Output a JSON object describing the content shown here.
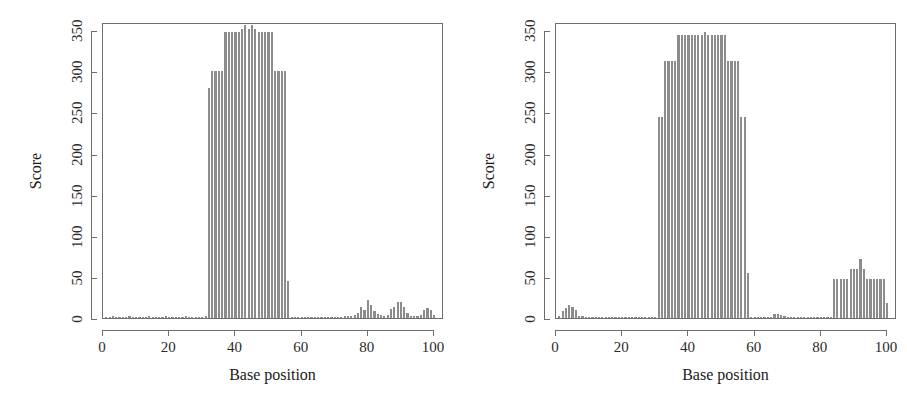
{
  "figure": {
    "panel_count": 2,
    "background_color": "#ffffff",
    "bar_color": "#8c8c8c",
    "axis_color": "#6e6e6e"
  },
  "chart_data": [
    {
      "id": "left-panel",
      "type": "bar",
      "title": "",
      "xlabel": "Base position",
      "ylabel": "Score",
      "xlim": [
        0,
        103
      ],
      "ylim": [
        0,
        360
      ],
      "xticks": [
        0,
        20,
        40,
        60,
        80,
        100
      ],
      "xticklabels": [
        "0",
        "20",
        "40",
        "60",
        "80",
        "100"
      ],
      "yticks": [
        0,
        50,
        100,
        150,
        200,
        250,
        300,
        350
      ],
      "yticklabels": [
        "0",
        "50",
        "100",
        "150",
        "200",
        "250",
        "300",
        "350"
      ],
      "grid": false,
      "legend": null,
      "x": [
        1,
        2,
        3,
        4,
        5,
        6,
        7,
        8,
        9,
        10,
        11,
        12,
        13,
        14,
        15,
        16,
        17,
        18,
        19,
        20,
        21,
        22,
        23,
        24,
        25,
        26,
        27,
        28,
        29,
        30,
        31,
        32,
        33,
        34,
        35,
        36,
        37,
        38,
        39,
        40,
        41,
        42,
        43,
        44,
        45,
        46,
        47,
        48,
        49,
        50,
        51,
        52,
        53,
        54,
        55,
        56,
        57,
        58,
        59,
        60,
        61,
        62,
        63,
        64,
        65,
        66,
        67,
        68,
        69,
        70,
        71,
        72,
        73,
        74,
        75,
        76,
        77,
        78,
        79,
        80,
        81,
        82,
        83,
        84,
        85,
        86,
        87,
        88,
        89,
        90,
        91,
        92,
        93,
        94,
        95,
        96,
        97,
        98,
        99,
        100
      ],
      "values": [
        1,
        1,
        2,
        1,
        1,
        1,
        1,
        2,
        1,
        1,
        1,
        1,
        1,
        2,
        1,
        1,
        1,
        1,
        2,
        1,
        1,
        1,
        1,
        1,
        2,
        1,
        1,
        1,
        1,
        1,
        2,
        280,
        300,
        300,
        300,
        300,
        348,
        348,
        348,
        348,
        348,
        352,
        356,
        352,
        356,
        352,
        348,
        348,
        348,
        348,
        348,
        300,
        300,
        300,
        300,
        45,
        1,
        1,
        1,
        1,
        1,
        1,
        1,
        1,
        1,
        1,
        1,
        1,
        1,
        1,
        1,
        1,
        2,
        2,
        3,
        4,
        6,
        14,
        10,
        22,
        16,
        8,
        5,
        4,
        3,
        4,
        11,
        14,
        20,
        20,
        14,
        6,
        3,
        2,
        2,
        4,
        10,
        12,
        10,
        4
      ]
    },
    {
      "id": "right-panel",
      "type": "bar",
      "title": "",
      "xlabel": "Base position",
      "ylabel": "Score",
      "xlim": [
        0,
        103
      ],
      "ylim": [
        0,
        360
      ],
      "xticks": [
        0,
        20,
        40,
        60,
        80,
        100
      ],
      "xticklabels": [
        "0",
        "20",
        "40",
        "60",
        "80",
        "100"
      ],
      "yticks": [
        0,
        50,
        100,
        150,
        200,
        250,
        300,
        350
      ],
      "yticklabels": [
        "0",
        "50",
        "100",
        "150",
        "200",
        "250",
        "300",
        "350"
      ],
      "grid": false,
      "legend": null,
      "x": [
        1,
        2,
        3,
        4,
        5,
        6,
        7,
        8,
        9,
        10,
        11,
        12,
        13,
        14,
        15,
        16,
        17,
        18,
        19,
        20,
        21,
        22,
        23,
        24,
        25,
        26,
        27,
        28,
        29,
        30,
        31,
        32,
        33,
        34,
        35,
        36,
        37,
        38,
        39,
        40,
        41,
        42,
        43,
        44,
        45,
        46,
        47,
        48,
        49,
        50,
        51,
        52,
        53,
        54,
        55,
        56,
        57,
        58,
        59,
        60,
        61,
        62,
        63,
        64,
        65,
        66,
        67,
        68,
        69,
        70,
        71,
        72,
        73,
        74,
        75,
        76,
        77,
        78,
        79,
        80,
        81,
        82,
        83,
        84,
        85,
        86,
        87,
        88,
        89,
        90,
        91,
        92,
        93,
        94,
        95,
        96,
        97,
        98,
        99,
        100
      ],
      "values": [
        2,
        8,
        12,
        16,
        14,
        10,
        2,
        2,
        1,
        1,
        1,
        1,
        1,
        1,
        1,
        1,
        1,
        1,
        1,
        1,
        1,
        1,
        1,
        1,
        1,
        1,
        1,
        1,
        1,
        1,
        245,
        245,
        312,
        312,
        312,
        312,
        344,
        344,
        344,
        344,
        344,
        344,
        344,
        344,
        348,
        344,
        344,
        344,
        344,
        344,
        344,
        312,
        312,
        312,
        312,
        245,
        245,
        55,
        1,
        1,
        1,
        1,
        1,
        1,
        1,
        5,
        5,
        4,
        2,
        1,
        1,
        1,
        1,
        1,
        1,
        1,
        1,
        1,
        1,
        1,
        1,
        1,
        1,
        48,
        48,
        48,
        48,
        48,
        60,
        60,
        60,
        72,
        60,
        48,
        48,
        48,
        48,
        48,
        48,
        18
      ]
    }
  ]
}
